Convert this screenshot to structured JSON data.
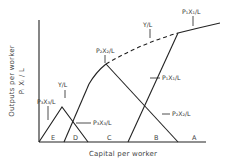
{
  "diagram": {
    "type": "economics-diagram",
    "title": "",
    "x_axis_label": "Capital per worker",
    "y_axis_label_line1": "Outputs per worker",
    "y_axis_label_line2": "Pᵢ Xᵢ / L",
    "curves": [
      {
        "id": "envelope",
        "label": "Y/L",
        "style": "solid-dashed envelope"
      },
      {
        "id": "p1x1",
        "label": "P₁X₁/L"
      },
      {
        "id": "p2x2",
        "label": "P₂X₂/L"
      },
      {
        "id": "p3x3_right",
        "label": "P₃X₃/L"
      },
      {
        "id": "p3x3_left",
        "label": "P₃X₃/L",
        "note": "subscript uncertain in source image"
      }
    ],
    "labels": {
      "p1x1_top": "P₁X₁/L",
      "p1x1_side": "P₁X₁/L",
      "p2x2_top": "P₂X₂/L",
      "p2x2_side": "P₂X₂/L",
      "p3x3_left": "P₃X₃/L",
      "p3x3_right": "P₃X₃/L",
      "yl_upper": "Y/L",
      "yl_lower": "Y/L"
    },
    "regions": [
      "E",
      "D",
      "C",
      "B",
      "A"
    ]
  }
}
